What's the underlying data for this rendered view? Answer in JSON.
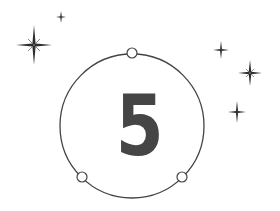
{
  "badge": {
    "number": "5",
    "ring_color": "#444444",
    "digit_color": "#454545"
  },
  "stars": [
    {
      "name": "large-sparkle",
      "x": 34,
      "y": 45,
      "size": 18
    },
    {
      "name": "small-sparkle-top",
      "x": 61,
      "y": 17,
      "size": 6
    },
    {
      "name": "sparkle-right-upper",
      "x": 221,
      "y": 50,
      "size": 8
    },
    {
      "name": "sparkle-right-middle",
      "x": 250,
      "y": 73,
      "size": 12
    },
    {
      "name": "sparkle-right-lower",
      "x": 237,
      "y": 112,
      "size": 10
    }
  ]
}
